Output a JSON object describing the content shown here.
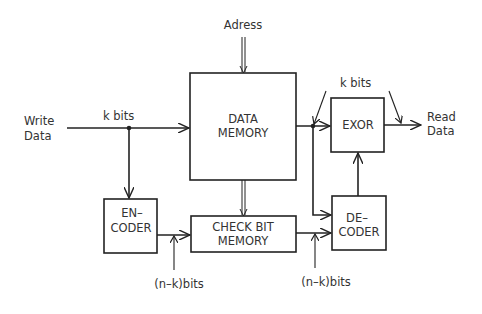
{
  "diagram": {
    "inputs": {
      "address": "Adress",
      "write_data": [
        "Write",
        "Data"
      ],
      "write_bits": "k bits"
    },
    "blocks": {
      "data_memory": [
        "DATA",
        "MEMORY"
      ],
      "encoder": [
        "EN–",
        "CODER"
      ],
      "check_bit_memory": [
        "CHECK  BIT",
        "MEMORY"
      ],
      "decoder": [
        "DE–",
        "CODER"
      ],
      "exor": "EXOR"
    },
    "outputs": {
      "read_data": [
        "Read",
        "Data"
      ],
      "read_bits": "k bits"
    },
    "annotations": {
      "check_bits_in": "(n–k)bits",
      "check_bits_out": "(n–k)bits"
    },
    "colors": {
      "line": "#222222",
      "text": "#333333",
      "background": "#ffffff"
    }
  }
}
